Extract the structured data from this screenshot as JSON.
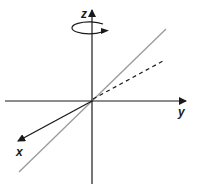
{
  "diagram": {
    "axes": {
      "z": {
        "label": "z"
      },
      "y": {
        "label": "y"
      },
      "x": {
        "label": "x"
      }
    },
    "rotation": {
      "about": "z",
      "direction": "counterclockwise-viewed-from-top"
    },
    "lines": [
      {
        "name": "diagonal-line",
        "style": "solid",
        "color": "#9a9a9a"
      },
      {
        "name": "projection-line",
        "style": "dashed",
        "color": "#1a1a1a"
      }
    ],
    "colors": {
      "axis": "#1a1a1a",
      "diagonal": "#9a9a9a",
      "background": "#ffffff"
    }
  }
}
